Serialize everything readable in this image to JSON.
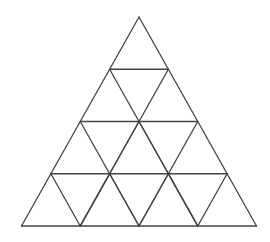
{
  "diagram": {
    "rows": 4,
    "apex": [
      139,
      17
    ],
    "base_y": 226,
    "base_left_x": 21,
    "base_right_x": 256,
    "stroke_color": "#444444",
    "stroke_width": 1.3,
    "background": "#ffffff",
    "small_triangle_count": 13,
    "note": "Top row cell is a single large triangle spanning two sub-rows; lower 3 rows subdivided into unit triangles"
  }
}
